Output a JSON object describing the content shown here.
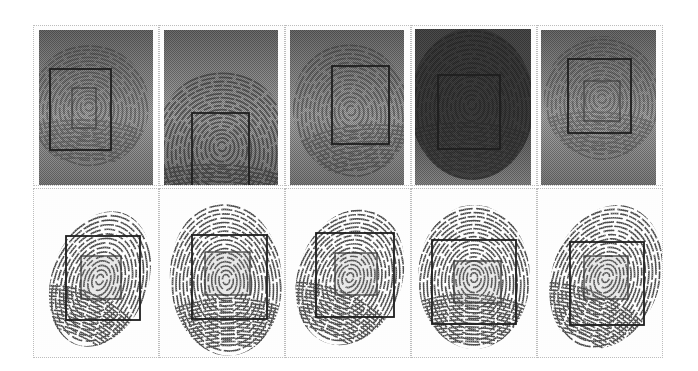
{
  "figure": {
    "rows": 2,
    "cols": 5,
    "grid": {
      "left": 33,
      "top": 25,
      "col_width": 126,
      "row_tops": [
        25,
        188
      ],
      "row_heights": [
        161,
        170
      ]
    },
    "colors": {
      "latent_bg_light": "#a8a8a8",
      "latent_bg_dark": "#5c5c5c",
      "ridge_dark": "#2a2a2a",
      "ridge_light": "#5a5a5a",
      "box_outer": "#1e1e1e",
      "box_inner": "#3a3a3a",
      "cell_border": "#bdbdbd",
      "rolled_bg": "#fdfdfd"
    },
    "top_row": [
      {
        "label": "latent-1",
        "img": [
          5,
          4,
          114,
          156
        ],
        "print": {
          "cx": 55,
          "cy": 80,
          "rx": 60,
          "ry": 62,
          "opacity": 0.35,
          "rot": 0
        },
        "outer": [
          16,
          43,
          61,
          81
        ],
        "inner": [
          38,
          62,
          24,
          40
        ],
        "shade": 0
      },
      {
        "label": "latent-2",
        "img": [
          4,
          4,
          114,
          156
        ],
        "print": {
          "cx": 62,
          "cy": 120,
          "rx": 68,
          "ry": 75,
          "opacity": 0.55,
          "rot": 0
        },
        "outer": [
          32,
          87,
          57,
          74
        ],
        "inner": null,
        "shade": 0
      },
      {
        "label": "latent-3",
        "img": [
          4,
          4,
          114,
          156
        ],
        "print": {
          "cx": 65,
          "cy": 84,
          "rx": 58,
          "ry": 68,
          "opacity": 0.4,
          "rot": -10
        },
        "outer": [
          46,
          40,
          57,
          78
        ],
        "inner": null,
        "shade": 0
      },
      {
        "label": "latent-4",
        "img": [
          3,
          3,
          116,
          157
        ],
        "print": {
          "cx": 60,
          "cy": 78,
          "rx": 62,
          "ry": 76,
          "opacity": 0.78,
          "rot": 0
        },
        "outer": [
          26,
          49,
          62,
          74
        ],
        "inner": null,
        "shade": 1
      },
      {
        "label": "latent-5",
        "img": [
          3,
          4,
          115,
          156
        ],
        "print": {
          "cx": 64,
          "cy": 72,
          "rx": 58,
          "ry": 62,
          "opacity": 0.32,
          "rot": 0
        },
        "outer": [
          30,
          33,
          63,
          74
        ],
        "inner": [
          46,
          55,
          36,
          40
        ],
        "shade": 0
      }
    ],
    "bottom_row": [
      {
        "label": "rolled-1",
        "print": {
          "cx": 66,
          "cy": 90,
          "rx": 48,
          "ry": 70,
          "rot": 20
        },
        "outer": [
          32,
          47,
          74,
          84
        ],
        "inner": [
          47,
          67,
          40,
          43
        ]
      },
      {
        "label": "rolled-2",
        "print": {
          "cx": 66,
          "cy": 90,
          "rx": 56,
          "ry": 77,
          "rot": -4
        },
        "outer": [
          32,
          46,
          75,
          84
        ],
        "inner": [
          45,
          63,
          45,
          43
        ]
      },
      {
        "label": "rolled-3",
        "print": {
          "cx": 64,
          "cy": 88,
          "rx": 52,
          "ry": 70,
          "rot": 20
        },
        "outer": [
          30,
          44,
          78,
          84
        ],
        "inner": [
          49,
          64,
          42,
          42
        ]
      },
      {
        "label": "rolled-4",
        "print": {
          "cx": 62,
          "cy": 88,
          "rx": 56,
          "ry": 72,
          "rot": 0
        },
        "outer": [
          20,
          51,
          84,
          84
        ],
        "inner": [
          42,
          72,
          47,
          42
        ]
      },
      {
        "label": "rolled-5",
        "print": {
          "cx": 68,
          "cy": 88,
          "rx": 54,
          "ry": 74,
          "rot": 20
        },
        "outer": [
          32,
          53,
          74,
          83
        ],
        "inner": [
          46,
          67,
          44,
          43
        ]
      }
    ]
  }
}
